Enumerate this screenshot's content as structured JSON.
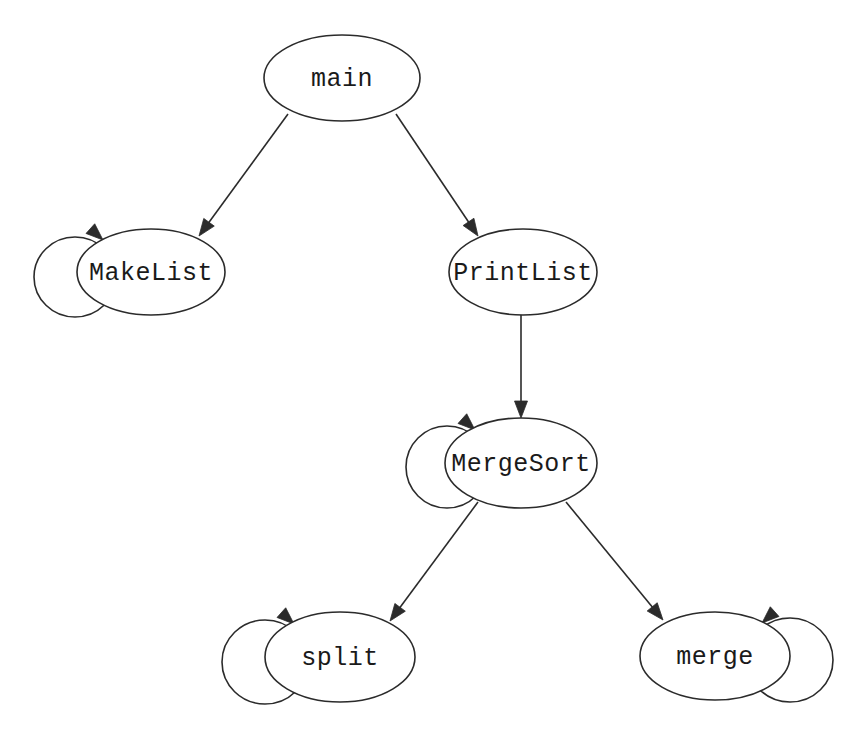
{
  "diagram": {
    "type": "call-graph",
    "background_color": "#ffffff",
    "stroke_color": "#2b2b2b",
    "text_color": "#1a1a1a",
    "width": 862,
    "height": 734,
    "nodes": [
      {
        "id": "main",
        "label": "main",
        "cx": 342,
        "cy": 78,
        "rx": 78,
        "ry": 43,
        "self_loop": false,
        "self_loop_side": ""
      },
      {
        "id": "MakeList",
        "label": "MakeList",
        "cx": 151,
        "cy": 272,
        "rx": 74,
        "ry": 43,
        "self_loop": true,
        "self_loop_side": "left"
      },
      {
        "id": "PrintList",
        "label": "PrintList",
        "cx": 523,
        "cy": 272,
        "rx": 74,
        "ry": 43,
        "self_loop": false,
        "self_loop_side": ""
      },
      {
        "id": "MergeSort",
        "label": "MergeSort",
        "cx": 521,
        "cy": 463,
        "rx": 76,
        "ry": 45,
        "self_loop": true,
        "self_loop_side": "left"
      },
      {
        "id": "split",
        "label": "split",
        "cx": 340,
        "cy": 657,
        "rx": 75,
        "ry": 45,
        "self_loop": true,
        "self_loop_side": "left"
      },
      {
        "id": "merge",
        "label": "merge",
        "cx": 715,
        "cy": 656,
        "rx": 75,
        "ry": 44,
        "self_loop": true,
        "self_loop_side": "right"
      }
    ],
    "edges": [
      {
        "id": "main-MakeList",
        "from": "main",
        "to": "MakeList",
        "x1": 288,
        "y1": 114,
        "x2": 199,
        "y2": 236
      },
      {
        "id": "main-PrintList",
        "from": "main",
        "to": "PrintList",
        "x1": 396,
        "y1": 114,
        "x2": 478,
        "y2": 236
      },
      {
        "id": "PrintList-MergeSort",
        "from": "PrintList",
        "to": "MergeSort",
        "x1": 521,
        "y1": 315,
        "x2": 521,
        "y2": 418
      },
      {
        "id": "MergeSort-split",
        "from": "MergeSort",
        "to": "split",
        "x1": 478,
        "y1": 502,
        "x2": 390,
        "y2": 621
      },
      {
        "id": "MergeSort-merge",
        "from": "MergeSort",
        "to": "merge",
        "x1": 566,
        "y1": 502,
        "x2": 663,
        "y2": 620
      }
    ],
    "self_loops": [
      {
        "id": "loop-MakeList",
        "node": "MakeList",
        "cx": 75,
        "cy": 277,
        "rx": 41,
        "ry": 40,
        "arrow_x": 103,
        "arrow_y": 240,
        "arrow_angle": 42
      },
      {
        "id": "loop-MergeSort",
        "node": "MergeSort",
        "cx": 447,
        "cy": 467,
        "rx": 41,
        "ry": 41,
        "arrow_x": 475,
        "arrow_y": 430,
        "arrow_angle": 42
      },
      {
        "id": "loop-split",
        "node": "split",
        "cx": 265,
        "cy": 662,
        "rx": 43,
        "ry": 42,
        "arrow_x": 294,
        "arrow_y": 624,
        "arrow_angle": 42
      },
      {
        "id": "loop-merge",
        "node": "merge",
        "cx": 790,
        "cy": 660,
        "rx": 43,
        "ry": 42,
        "arrow_x": 762,
        "arrow_y": 623,
        "arrow_angle": 138
      }
    ]
  }
}
